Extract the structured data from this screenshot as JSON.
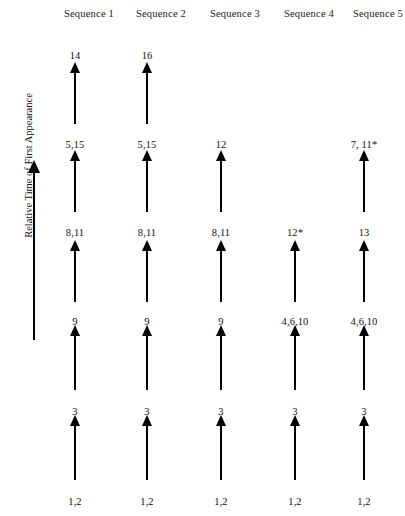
{
  "figure": {
    "title": "",
    "axis": {
      "label": "Relative Time of First Appearance",
      "arrow_direction": "up",
      "icon": "up-arrow-icon"
    },
    "columns": [
      {
        "header": "Sequence  1",
        "x": 75
      },
      {
        "header": "Sequence 2",
        "x": 147
      },
      {
        "header": "Sequence 3",
        "x": 221
      },
      {
        "header": "Sequence 4",
        "x": 295
      },
      {
        "header": "Sequence 5",
        "x": 364
      }
    ],
    "levels": [
      {
        "index": 0,
        "label_y": 496
      },
      {
        "index": 1,
        "label_y": 406
      },
      {
        "index": 2,
        "label_y": 316
      },
      {
        "index": 3,
        "label_y": 227
      },
      {
        "index": 4,
        "label_y": 139
      },
      {
        "index": 5,
        "label_y": 50
      }
    ],
    "nodes": [
      {
        "column": 0,
        "level": 0,
        "label": "1,2"
      },
      {
        "column": 1,
        "level": 0,
        "label": "1,2"
      },
      {
        "column": 2,
        "level": 0,
        "label": "1,2"
      },
      {
        "column": 3,
        "level": 0,
        "label": "1,2"
      },
      {
        "column": 4,
        "level": 0,
        "label": "1,2"
      },
      {
        "column": 0,
        "level": 1,
        "label": "3"
      },
      {
        "column": 1,
        "level": 1,
        "label": "3"
      },
      {
        "column": 2,
        "level": 1,
        "label": "3"
      },
      {
        "column": 3,
        "level": 1,
        "label": "3"
      },
      {
        "column": 4,
        "level": 1,
        "label": "3"
      },
      {
        "column": 0,
        "level": 2,
        "label": "9"
      },
      {
        "column": 1,
        "level": 2,
        "label": "9"
      },
      {
        "column": 2,
        "level": 2,
        "label": "9"
      },
      {
        "column": 3,
        "level": 2,
        "label": "4,6,10"
      },
      {
        "column": 4,
        "level": 2,
        "label": "4,6,10"
      },
      {
        "column": 0,
        "level": 3,
        "label": "8,11"
      },
      {
        "column": 1,
        "level": 3,
        "label": "8,11"
      },
      {
        "column": 2,
        "level": 3,
        "label": "8,11"
      },
      {
        "column": 3,
        "level": 3,
        "label": "12*"
      },
      {
        "column": 4,
        "level": 3,
        "label": "13"
      },
      {
        "column": 0,
        "level": 4,
        "label": "5,15"
      },
      {
        "column": 1,
        "level": 4,
        "label": "5,15"
      },
      {
        "column": 2,
        "level": 4,
        "label": "12"
      },
      {
        "column": 4,
        "level": 4,
        "label": "7, 11*"
      },
      {
        "column": 0,
        "level": 5,
        "label": "14"
      },
      {
        "column": 1,
        "level": 5,
        "label": "16"
      }
    ],
    "arrows": [
      {
        "column": 0,
        "from_level": 0,
        "to_level": 1,
        "top": 415,
        "height": 65
      },
      {
        "column": 1,
        "from_level": 0,
        "to_level": 1,
        "top": 415,
        "height": 65
      },
      {
        "column": 2,
        "from_level": 0,
        "to_level": 1,
        "top": 415,
        "height": 65
      },
      {
        "column": 3,
        "from_level": 0,
        "to_level": 1,
        "top": 415,
        "height": 65
      },
      {
        "column": 4,
        "from_level": 0,
        "to_level": 1,
        "top": 415,
        "height": 65
      },
      {
        "column": 0,
        "from_level": 1,
        "to_level": 2,
        "top": 325,
        "height": 65
      },
      {
        "column": 1,
        "from_level": 1,
        "to_level": 2,
        "top": 325,
        "height": 65
      },
      {
        "column": 2,
        "from_level": 1,
        "to_level": 2,
        "top": 325,
        "height": 65
      },
      {
        "column": 3,
        "from_level": 1,
        "to_level": 2,
        "top": 325,
        "height": 65
      },
      {
        "column": 4,
        "from_level": 1,
        "to_level": 2,
        "top": 325,
        "height": 65
      },
      {
        "column": 0,
        "from_level": 2,
        "to_level": 3,
        "top": 240,
        "height": 62
      },
      {
        "column": 1,
        "from_level": 2,
        "to_level": 3,
        "top": 240,
        "height": 62
      },
      {
        "column": 2,
        "from_level": 2,
        "to_level": 3,
        "top": 240,
        "height": 62
      },
      {
        "column": 3,
        "from_level": 2,
        "to_level": 3,
        "top": 240,
        "height": 62
      },
      {
        "column": 4,
        "from_level": 2,
        "to_level": 3,
        "top": 240,
        "height": 62
      },
      {
        "column": 0,
        "from_level": 3,
        "to_level": 4,
        "top": 150,
        "height": 62
      },
      {
        "column": 1,
        "from_level": 3,
        "to_level": 4,
        "top": 150,
        "height": 62
      },
      {
        "column": 2,
        "from_level": 3,
        "to_level": 4,
        "top": 150,
        "height": 62
      },
      {
        "column": 4,
        "from_level": 3,
        "to_level": 4,
        "top": 150,
        "height": 62
      },
      {
        "column": 0,
        "from_level": 4,
        "to_level": 5,
        "top": 62,
        "height": 62
      },
      {
        "column": 1,
        "from_level": 4,
        "to_level": 5,
        "top": 62,
        "height": 62
      }
    ]
  }
}
